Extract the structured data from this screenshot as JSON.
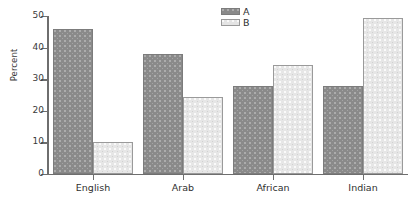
{
  "chart_data": {
    "type": "bar",
    "title": "",
    "subtitle": "",
    "xlabel": "",
    "ylabel": "Percent",
    "categories": [
      "English",
      "Arab",
      "African",
      "Indian"
    ],
    "series": [
      {
        "name": "A",
        "values": [
          46,
          38,
          28,
          28
        ],
        "color": "#8a8a8a"
      },
      {
        "name": "B",
        "values": [
          10,
          24.5,
          34.5,
          49.5
        ],
        "color": "#e6e6e6"
      }
    ],
    "ylim": [
      0,
      50
    ],
    "yticks": [
      0,
      10,
      20,
      30,
      40,
      50
    ],
    "ytick_labels": [
      "0",
      "10",
      "20",
      "30",
      "40",
      "50"
    ],
    "grid": false,
    "legend_position": "top-center-right",
    "legend_entries": [
      "A",
      "B"
    ],
    "bar_style": "grouped-adjacent-dotted-fill"
  },
  "axes": {
    "y_title": "Percent"
  },
  "legend": {
    "a_label": "A",
    "b_label": "B"
  },
  "caption": {
    "partial_text": ""
  }
}
